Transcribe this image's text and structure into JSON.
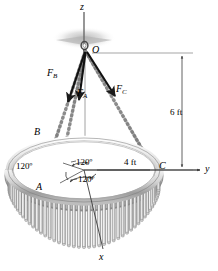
{
  "figure": {
    "axes": [
      {
        "id": "z",
        "label": "z",
        "x": 80,
        "y": 2
      },
      {
        "id": "y",
        "label": "y",
        "x": 205,
        "y": 164
      },
      {
        "id": "x",
        "label": "x",
        "x": 99,
        "y": 252
      }
    ],
    "points": [
      {
        "id": "O",
        "label": "O",
        "x": 92,
        "y": 45
      },
      {
        "id": "A",
        "label": "A",
        "x": 36,
        "y": 182
      },
      {
        "id": "B",
        "label": "B",
        "x": 34,
        "y": 127
      },
      {
        "id": "C",
        "label": "C",
        "x": 159,
        "y": 161
      }
    ],
    "forces": [
      {
        "id": "FA",
        "label": "F",
        "sub": "A",
        "x": 77,
        "y": 88
      },
      {
        "id": "FB",
        "label": "F",
        "sub": "B",
        "x": 47,
        "y": 68
      },
      {
        "id": "FC",
        "label": "F",
        "sub": "C",
        "x": 116,
        "y": 84
      }
    ],
    "dimensions": [
      {
        "id": "height",
        "label": "6 ft",
        "x": 170,
        "y": 108
      },
      {
        "id": "radius",
        "label": "4 ft",
        "x": 124,
        "y": 158
      }
    ],
    "angles": [
      {
        "id": "angle-left",
        "label": "120º",
        "x": 16,
        "y": 162
      },
      {
        "id": "angle-top-right",
        "label": "120º",
        "x": 76,
        "y": 158
      },
      {
        "id": "angle-bottom",
        "label": "120º",
        "x": 78,
        "y": 175
      }
    ],
    "colors": {
      "line": "#1a1a1a",
      "ring_light": "#e8e8e8",
      "ring_mid": "#c8c8c8",
      "ring_dark": "#9a9a9a",
      "fringe_light": "#f0f0f0",
      "fringe_dark": "#a8a8a8",
      "chain": "#b0b0b0",
      "ceiling_shadow": "#cfcfcf",
      "thin_rule": "#555555"
    }
  }
}
